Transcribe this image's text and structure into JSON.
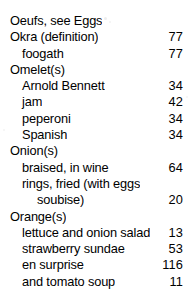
{
  "page": {
    "type": "book-index",
    "background_color": "#ffffff",
    "text_color": "#000000"
  },
  "index_entries": [
    {
      "label": "Oeufs, see Eggs",
      "page": "",
      "level": 0
    },
    {
      "label": "Okra (definition)",
      "page": "77",
      "level": 0
    },
    {
      "label": "foogath",
      "page": "77",
      "level": 1
    },
    {
      "label": "Omelet(s)",
      "page": "",
      "level": 0
    },
    {
      "label": "Arnold Bennett",
      "page": "34",
      "level": 1
    },
    {
      "label": "jam",
      "page": "42",
      "level": 1
    },
    {
      "label": "peperoni",
      "page": "34",
      "level": 1
    },
    {
      "label": "Spanish",
      "page": "34",
      "level": 1
    },
    {
      "label": "Onion(s)",
      "page": "",
      "level": 0
    },
    {
      "label": "braised, in wine",
      "page": "64",
      "level": 1
    },
    {
      "label": "rings, fried (with eggs",
      "page": "",
      "level": 1
    },
    {
      "label": "soubise)",
      "page": "20",
      "level": 2
    },
    {
      "label": "Orange(s)",
      "page": "",
      "level": 0
    },
    {
      "label": "lettuce and onion salad",
      "page": "13",
      "level": 1
    },
    {
      "label": "strawberry sundae",
      "page": "53",
      "level": 1
    },
    {
      "label": "en surprise",
      "page": "116",
      "level": 1
    },
    {
      "label": "and tomato soup",
      "page": "11",
      "level": 1
    }
  ]
}
